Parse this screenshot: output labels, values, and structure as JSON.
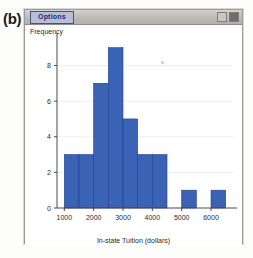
{
  "figure": {
    "part_label": "(b)"
  },
  "window": {
    "options_button_label": "Options",
    "controls": [
      {
        "name": "restore",
        "glyph": "❐"
      },
      {
        "name": "close",
        "glyph": "×"
      }
    ]
  },
  "chart_data": {
    "type": "bar",
    "title": "",
    "xlabel": "In-state Tuition (dollars)",
    "ylabel": "Frequency",
    "xlim": [
      750,
      6750
    ],
    "ylim": [
      0,
      9.6
    ],
    "xticks": [
      1000,
      2000,
      3000,
      4000,
      5000,
      6000
    ],
    "xticklabels": [
      "1000",
      "2000",
      "3000",
      "4000",
      "5000",
      "6000"
    ],
    "yticks": [
      0,
      2,
      4,
      6,
      8
    ],
    "yticklabels": [
      "0",
      "2",
      "4",
      "6",
      "8"
    ],
    "grid": true,
    "bin_width": 500,
    "bar_color": "#3b63b5",
    "bar_edge_color": "#1f3f8f",
    "bins": [
      {
        "left": 1000,
        "right": 1500,
        "value": 3
      },
      {
        "left": 1500,
        "right": 2000,
        "value": 3
      },
      {
        "left": 2000,
        "right": 2500,
        "value": 7
      },
      {
        "left": 2500,
        "right": 3000,
        "value": 9
      },
      {
        "left": 3000,
        "right": 3500,
        "value": 5
      },
      {
        "left": 3500,
        "right": 4000,
        "value": 3
      },
      {
        "left": 4000,
        "right": 4500,
        "value": 3
      },
      {
        "left": 5000,
        "right": 5500,
        "value": 1
      },
      {
        "left": 6000,
        "right": 6500,
        "value": 1
      }
    ],
    "categories": [
      "1000-1500",
      "1500-2000",
      "2000-2500",
      "2500-3000",
      "3000-3500",
      "3500-4000",
      "4000-4500",
      "4500-5000",
      "5000-5500",
      "5500-6000",
      "6000-6500"
    ],
    "values": [
      3,
      3,
      7,
      9,
      5,
      3,
      3,
      0,
      1,
      0,
      1
    ]
  }
}
